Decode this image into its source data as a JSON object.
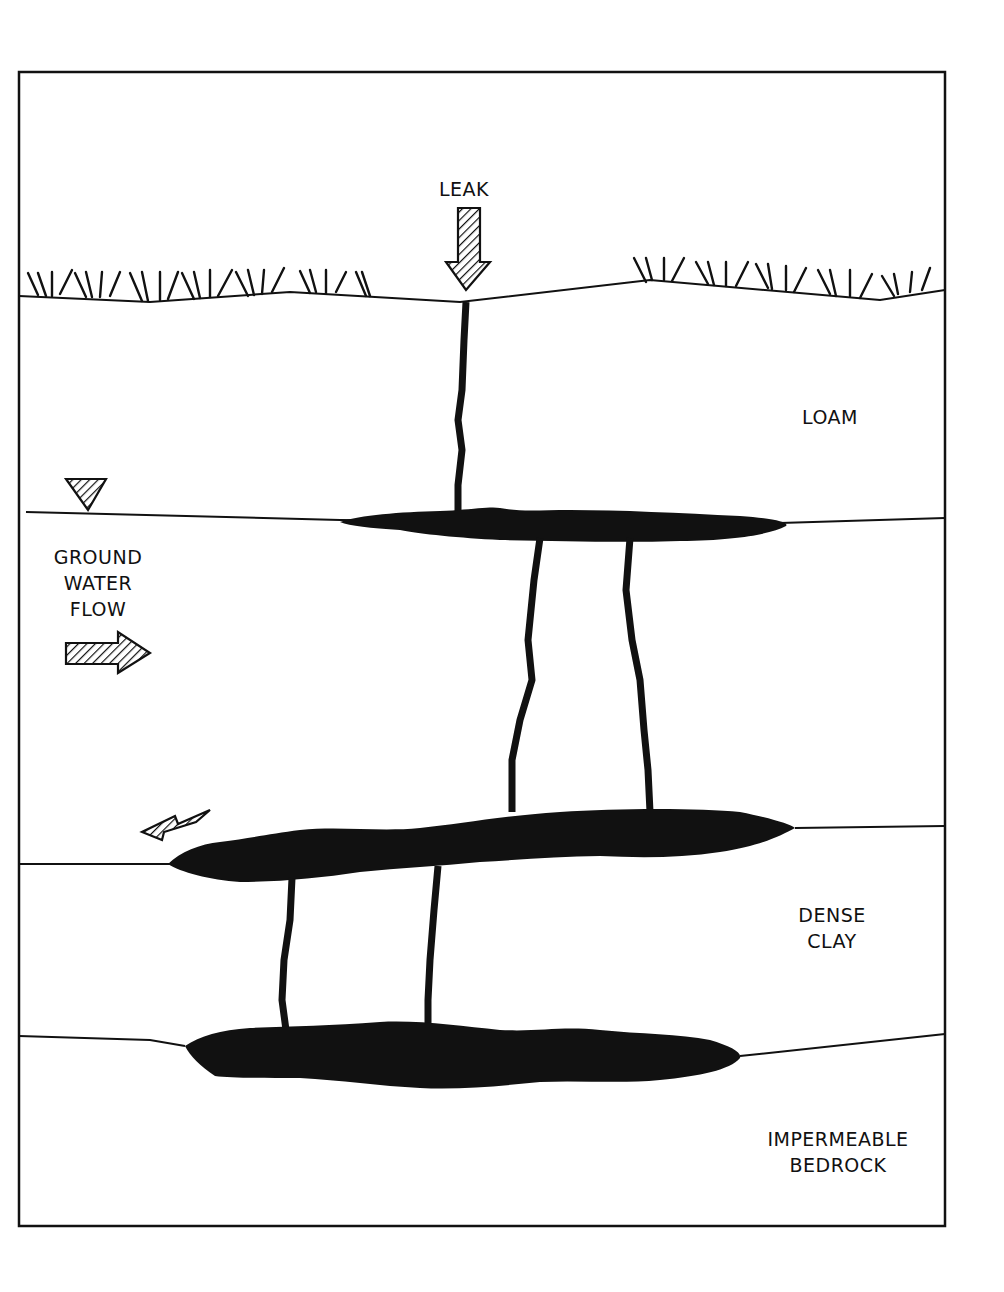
{
  "diagram": {
    "labels": {
      "leak": "LEAK",
      "loam": "LOAM",
      "ground_water_flow": [
        "GROUND",
        "WATER",
        "FLOW"
      ],
      "dense_clay": [
        "DENSE",
        "CLAY"
      ],
      "impermeable_bedrock": [
        "IMPERMEABLE",
        "BEDROCK"
      ]
    },
    "layers": [
      {
        "name": "surface-vegetation",
        "y_approx": 295
      },
      {
        "name": "loam",
        "boundary_y_approx": 515
      },
      {
        "name": "ground-water-zone",
        "boundary_y_approx": 860
      },
      {
        "name": "dense-clay",
        "boundary_y_approx": 1040
      },
      {
        "name": "impermeable-bedrock"
      }
    ],
    "symbols": {
      "leak_arrow": "down-hatched-arrow",
      "water_table_marker": "inverted-triangle-hatched",
      "ground_water_flow_arrow": "right-hatched-arrow",
      "migration_arrow": "down-left-hatched-arrow"
    },
    "colors": {
      "ink": "#111111",
      "background": "#ffffff"
    }
  }
}
